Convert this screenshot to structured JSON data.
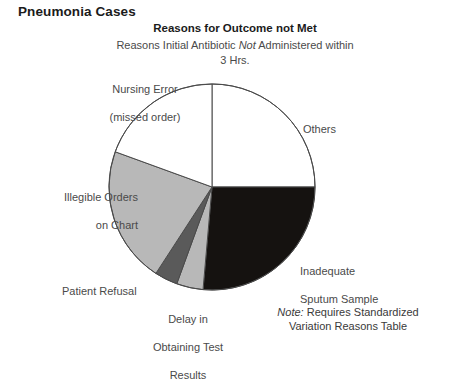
{
  "page": {
    "main_title": "Pneumonia Cases"
  },
  "chart_header": {
    "title": "Reasons for Outcome not Met",
    "subtitle_part1": "Reasons Initial Antibiotic ",
    "subtitle_italic": "Not",
    "subtitle_part2": " Administered within",
    "subtitle_line2": "3 Hrs."
  },
  "note": {
    "label": "Note:",
    "text_line1": " Requires Standardized",
    "text_line2": "Variation Reasons Table"
  },
  "chart_data": {
    "type": "pie",
    "title": "Reasons for Outcome not Met",
    "subtitle": "Reasons Initial Antibiotic Not Administered within 3 Hrs.",
    "legend": "inline-labels",
    "start_angle_deg": 0,
    "direction": "clockwise",
    "categories": [
      "Others",
      "Inadequate Sputum Sample",
      "Delay in Obtaining Test Results",
      "Patient Refusal",
      "Illegible Orders on Chart",
      "Nursing Error (missed order)"
    ],
    "values": [
      25,
      26,
      4,
      4,
      22,
      19
    ],
    "colors": [
      "#ffffff",
      "#151210",
      "#b8b8b8",
      "#5a5a5a",
      "#b8b8b8",
      "#ffffff"
    ],
    "slices": [
      {
        "label": "Others",
        "label_line1": "Others",
        "label_line2": "",
        "value": 25,
        "start_deg": 0,
        "end_deg": 90,
        "color": "#ffffff"
      },
      {
        "label": "Inadequate Sputum Sample",
        "label_line1": "Inadequate",
        "label_line2": "Sputum Sample",
        "value": 26,
        "start_deg": 90,
        "end_deg": 185,
        "color": "#151210"
      },
      {
        "label": "Delay in Obtaining Test Results",
        "label_line1": "Delay in",
        "label_line2": "Obtaining Test",
        "label_line3": "Results",
        "value": 4,
        "start_deg": 185,
        "end_deg": 200,
        "color": "#b8b8b8"
      },
      {
        "label": "Patient Refusal",
        "label_line1": "Patient Refusal",
        "label_line2": "",
        "value": 4,
        "start_deg": 200,
        "end_deg": 213,
        "color": "#5a5a5a"
      },
      {
        "label": "Illegible Orders on Chart",
        "label_line1": "Illegible Orders",
        "label_line2": "on Chart",
        "value": 22,
        "start_deg": 213,
        "end_deg": 290,
        "color": "#b8b8b8"
      },
      {
        "label": "Nursing Error (missed order)",
        "label_line1": "Nursing Error",
        "label_line2": "(missed order)",
        "value": 19,
        "start_deg": 290,
        "end_deg": 360,
        "color": "#ffffff"
      }
    ],
    "stroke_color": "#4a4a4a",
    "center": [
      104,
      104
    ],
    "radius": 103
  }
}
